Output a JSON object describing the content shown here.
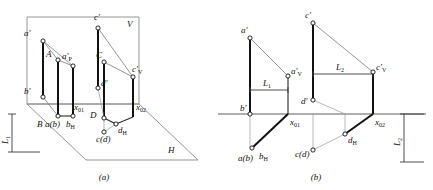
{
  "figure": {
    "panels": [
      {
        "caption": "(a)",
        "name": "pictorial-view"
      },
      {
        "caption": "(b)",
        "name": "orthographic-view"
      }
    ]
  },
  "panel_a": {
    "caption": "(a)",
    "plane_labels": {
      "vertical": "V",
      "horizontal": "H"
    },
    "points": [
      {
        "id": "a-prime",
        "label": "a′",
        "x": 32,
        "y": 36
      },
      {
        "id": "c-prime",
        "label": "c′",
        "x": 98,
        "y": 22
      },
      {
        "id": "A",
        "label": "A",
        "x": 52,
        "y": 56
      },
      {
        "id": "ap-prime",
        "label": "a′",
        "sub": "P",
        "x": 68,
        "y": 62
      },
      {
        "id": "C",
        "label": "C",
        "x": 104,
        "y": 56
      },
      {
        "id": "cv-prime",
        "label": "c′",
        "sub": "V",
        "x": 132,
        "y": 68
      },
      {
        "id": "b-prime",
        "label": "b′",
        "x": 32,
        "y": 96
      },
      {
        "id": "d-prime",
        "label": "d′",
        "x": 72,
        "y": 83
      },
      {
        "id": "x01",
        "label": "x",
        "sub": "01",
        "x": 68,
        "y": 110
      },
      {
        "id": "x02",
        "label": "x",
        "sub": "02",
        "x": 132,
        "y": 110
      },
      {
        "id": "B",
        "label": "B",
        "x": 46,
        "y": 122
      },
      {
        "id": "ab",
        "label": "a(b)",
        "x": 56,
        "y": 122
      },
      {
        "id": "bH",
        "label": "b",
        "sub": "H",
        "x": 72,
        "y": 122
      },
      {
        "id": "D",
        "label": "D",
        "x": 96,
        "y": 112
      },
      {
        "id": "dH",
        "label": "d",
        "sub": "H",
        "x": 114,
        "y": 126
      },
      {
        "id": "cd",
        "label": "c(d)",
        "x": 102,
        "y": 138
      }
    ],
    "point_labels": [
      "a′",
      "c′",
      "A",
      "a′P",
      "C",
      "c′V",
      "b′",
      "d′",
      "x01",
      "x02",
      "B",
      "a(b)",
      "bH",
      "D",
      "dH",
      "c(d)"
    ]
  },
  "panel_b": {
    "caption": "(b)",
    "points": [
      {
        "id": "a-prime",
        "label": "a′",
        "x": 250,
        "y": 32
      },
      {
        "id": "c-prime",
        "label": "c′",
        "x": 313,
        "y": 17
      },
      {
        "id": "av-prime",
        "label": "a′",
        "sub": "V",
        "x": 288,
        "y": 72
      },
      {
        "id": "cv-prime",
        "label": "c′",
        "sub": "V",
        "x": 373,
        "y": 66
      },
      {
        "id": "b-prime",
        "label": "b′",
        "x": 250,
        "y": 112
      },
      {
        "id": "d-prime",
        "label": "d′",
        "x": 313,
        "y": 98
      },
      {
        "id": "x01",
        "label": "x",
        "sub": "01",
        "x": 288,
        "y": 118
      },
      {
        "id": "x02",
        "label": "x",
        "sub": "02",
        "x": 373,
        "y": 118
      },
      {
        "id": "ab",
        "label": "a(b)",
        "x": 250,
        "y": 154
      },
      {
        "id": "bH",
        "label": "b",
        "sub": "H",
        "x": 265,
        "y": 152
      },
      {
        "id": "cd",
        "label": "c(d)",
        "x": 313,
        "y": 155
      },
      {
        "id": "dH",
        "label": "d",
        "sub": "H",
        "x": 345,
        "y": 140
      }
    ],
    "dimensions": [
      {
        "id": "L1-horizontal",
        "label": "L",
        "sub": "1",
        "x": 268,
        "y": 88
      },
      {
        "id": "L2-horizontal",
        "label": "L",
        "sub": "2",
        "x": 340,
        "y": 75
      },
      {
        "id": "L1-vertical",
        "label": "L",
        "sub": "1",
        "x": 6,
        "y": 136
      },
      {
        "id": "L2-vertical",
        "label": "L",
        "sub": "2",
        "x": 404,
        "y": 140
      }
    ],
    "dimension_labels": [
      "L1",
      "L2",
      "L1",
      "L2"
    ]
  },
  "colors": {
    "stroke_heavy": "#111111",
    "stroke_medium": "#2a2a2a",
    "stroke_thin": "#7b7b7b",
    "node_fill": "#ffffff",
    "background": "#ffffff"
  }
}
